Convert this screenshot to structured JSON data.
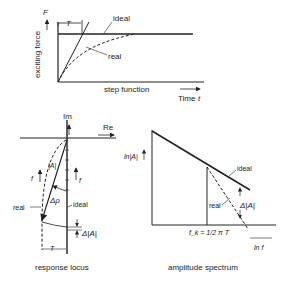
{
  "top_diagram": {
    "y_axis_label": "exciting force",
    "y_symbol": "F",
    "x_label": "Time",
    "x_symbol": "t",
    "baseline_label": "step function",
    "time_constant": "T",
    "curve_ideal": "ideal",
    "curve_real": "real"
  },
  "response_locus": {
    "title": "response locus",
    "axis_im": "Im",
    "axis_re": "Re",
    "magnitude": "|A|",
    "freq_symbol": "f",
    "phase_delta": "Δρ",
    "curve_real": "real",
    "curve_ideal": "ideal",
    "magnitude_delta": "Δ|A|",
    "time_constant": "T"
  },
  "amplitude_spectrum": {
    "title": "amplitude spectrum",
    "y_axis_label": "ln|A|",
    "x_axis_label": "ln f",
    "corner_freq_label": "f_k = 1/2 π T",
    "curve_ideal": "ideal",
    "curve_real": "real",
    "magnitude_delta": "Δ|A|"
  }
}
